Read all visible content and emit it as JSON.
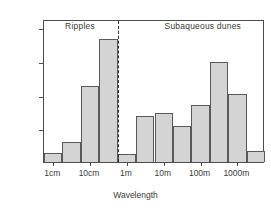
{
  "chart_data": {
    "type": "bar",
    "title": "",
    "xlabel": "Wavelength",
    "ylabel": "",
    "ylim": [
      0,
      21.2
    ],
    "grid": false,
    "legend_position": "none",
    "bar_fill_color": "#d4d4d4",
    "bar_edge_color": "#595959",
    "axis_color": "#4d4d4d",
    "categories": [
      "1cm",
      "",
      "",
      "10cm",
      "",
      "1m",
      "",
      "10m",
      "",
      "100m",
      "",
      "1000m"
    ],
    "values": [
      1.3,
      2.9,
      11.3,
      18.2,
      1.2,
      6.8,
      7.3,
      5.3,
      8.4,
      14.9,
      10.1,
      1.6
    ],
    "ytick_labels": [
      "5%",
      "10%",
      "15%",
      "20%"
    ],
    "ytick_values": [
      5,
      10,
      15,
      20
    ],
    "xtick_labels": [
      "1cm",
      "10cm",
      "1m",
      "10m",
      "100m",
      "1000m"
    ],
    "xtick_positions": [
      0.5,
      2.5,
      4.5,
      6.5,
      8.5,
      10.5
    ],
    "annotations": [
      {
        "text": "Ripples",
        "at_bar": 1.2
      },
      {
        "text": "Subaqueous dunes",
        "at_bar": 6.6
      }
    ],
    "divider": {
      "at_bar": 4.0,
      "style": "dashed"
    }
  }
}
